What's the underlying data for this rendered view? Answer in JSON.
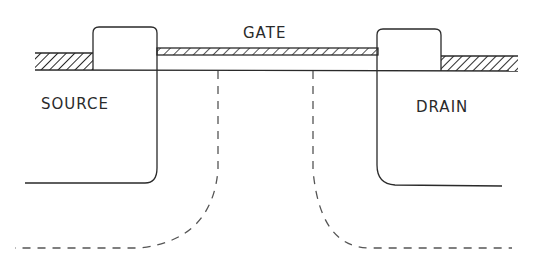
{
  "diagram": {
    "labels": {
      "gate": "GATE",
      "source": "SOURCE",
      "drain": "DRAIN"
    },
    "colors": {
      "line": "#2a2a2a",
      "background": "#ffffff"
    }
  }
}
